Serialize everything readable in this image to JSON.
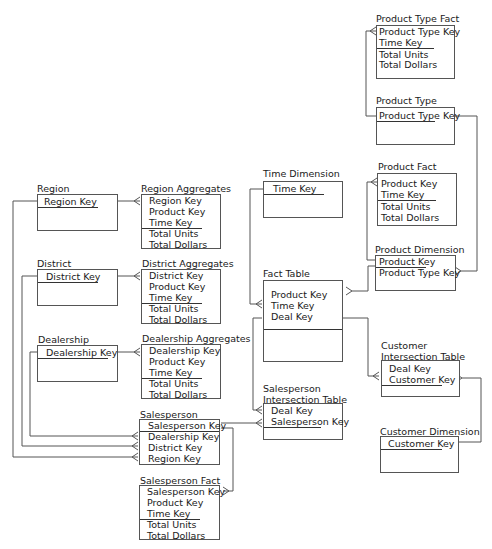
{
  "tables": {
    "product_type_fact": {
      "title": "Product Type Fact",
      "fields": [
        "Product Type Key",
        "Time Key",
        "Total Units",
        "Total Dollars"
      ]
    },
    "product_type": {
      "title": "Product Type",
      "fields": [
        "Product Type Key"
      ]
    },
    "product_fact": {
      "title": "Product Fact",
      "fields": [
        "Product Key",
        "Time Key",
        "Total Units",
        "Total Dollars"
      ]
    },
    "product_dimension": {
      "title": "Product Dimension",
      "fields": [
        "Product Key",
        "Product  Type Key"
      ]
    },
    "time_dimension": {
      "title": "Time Dimension",
      "fields": [
        "Time Key"
      ]
    },
    "fact_table": {
      "title": "Fact Table",
      "fields": [
        "Product Key",
        "Time Key",
        "Deal Key"
      ]
    },
    "customer_intersection": {
      "title_line1": "Customer",
      "title_line2": "Intersection Table",
      "fields": [
        "Deal Key",
        "Customer Key"
      ]
    },
    "customer_dimension": {
      "title": "Customer Dimension",
      "fields": [
        "Customer Key"
      ]
    },
    "salesperson_intersection": {
      "title_line1": "Salesperson",
      "title_line2": "Intersection Table",
      "fields": [
        "Deal Key",
        "Salesperson Key"
      ]
    },
    "region": {
      "title": "Region",
      "fields": [
        "Region Key"
      ]
    },
    "region_aggregates": {
      "title": "Region Aggregates",
      "fields": [
        "Region Key",
        "Product Key",
        "Time Key",
        "Total Units",
        "Total Dollars"
      ]
    },
    "district": {
      "title": "District",
      "fields": [
        "District Key"
      ]
    },
    "district_aggregates": {
      "title": "District Aggregates",
      "fields": [
        "District Key",
        "Product Key",
        "Time Key",
        "Total Units",
        "Total Dollars"
      ]
    },
    "dealership": {
      "title": "Dealership",
      "fields": [
        "Dealership Key"
      ]
    },
    "dealership_aggregates": {
      "title": "Dealership Aggregates",
      "fields": [
        "Dealership Key",
        "Product Key",
        "Time Key",
        "Total Units",
        "Total Dollars"
      ]
    },
    "salesperson": {
      "title": "Salesperson",
      "fields": [
        "Salesperson Key",
        "Dealership Key",
        "District Key",
        "Region Key"
      ]
    },
    "salesperson_fact": {
      "title": "Salesperson Fact",
      "fields": [
        "Salesperson Key",
        "Product Key",
        "Time Key",
        "Total Units",
        "Total Dollars"
      ]
    }
  }
}
